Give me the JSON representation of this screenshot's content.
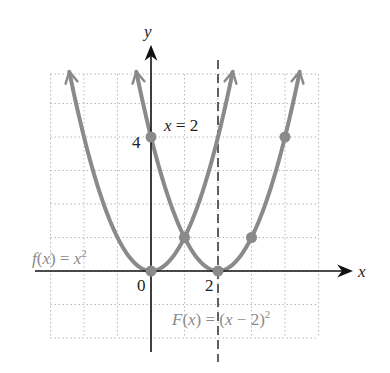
{
  "chart_data": {
    "type": "line",
    "title": "",
    "xlabel": "x",
    "ylabel": "y",
    "xlim": [
      -3,
      5
    ],
    "ylim": [
      -2,
      6
    ],
    "grid": true,
    "grid_style": "dotted",
    "tick_labels": {
      "origin": "0",
      "x": [
        "2"
      ],
      "y": [
        "4"
      ]
    },
    "series": [
      {
        "name": "f(x) = x^2",
        "label_text": "f(x) = x",
        "label_sup": "2",
        "formula": "x^2",
        "vertex": [
          0,
          0
        ],
        "marked_points": [
          [
            0,
            0
          ],
          [
            1,
            1
          ]
        ],
        "color": "#8a8a8a"
      },
      {
        "name": "F(x) = (x - 2)^2",
        "label_text": "F(x) = (x − 2)",
        "label_sup": "2",
        "formula": "(x-2)^2",
        "vertex": [
          2,
          0
        ],
        "marked_points": [
          [
            0,
            4
          ],
          [
            1,
            1
          ],
          [
            2,
            0
          ],
          [
            3,
            1
          ],
          [
            4,
            4
          ]
        ],
        "color": "#8a8a8a"
      }
    ],
    "annotations": [
      {
        "type": "vertical_dashed_line",
        "x": 2,
        "label": "x = 2"
      }
    ]
  },
  "labels": {
    "x_axis": "x",
    "y_axis": "y",
    "origin": "0",
    "tick_x2": "2",
    "tick_y4": "4",
    "asymptote": "x = 2",
    "f_label": "f(x) = x",
    "f_sup": "2",
    "F_label": "F(x) = (x − 2)",
    "F_sup": "2"
  }
}
